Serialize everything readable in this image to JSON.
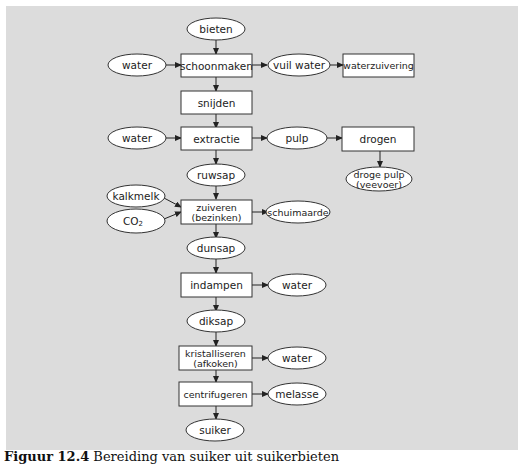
{
  "diagram": {
    "title": "Bereiding van suiker uit suikerbieten",
    "nodes": {
      "bieten": "bieten",
      "water1": "water",
      "schoonmaken": "schoonmaken",
      "vuil_water": "vuil water",
      "waterzuivering": "waterzuivering",
      "snijden": "snijden",
      "water2": "water",
      "extractie": "extractie",
      "pulp": "pulp",
      "drogen": "drogen",
      "droge_pulp_l1": "droge pulp",
      "droge_pulp_l2": "(veevoer)",
      "ruwsap": "ruwsap",
      "kalkmelk": "kalkmelk",
      "co2": "CO",
      "co2_sub": "2",
      "zuiveren_l1": "zuiveren",
      "zuiveren_l2": "(bezinken)",
      "schuimaarde": "schuimaarde",
      "dunsap": "dunsap",
      "indampen": "indampen",
      "water3": "water",
      "diksap": "diksap",
      "kristalliseren_l1": "kristalliseren",
      "kristalliseren_l2": "(afkoken)",
      "water4": "water",
      "centrifugeren": "centrifugeren",
      "melasse": "melasse",
      "suiker": "suiker"
    },
    "edges": [
      [
        "bieten",
        "schoonmaken"
      ],
      [
        "water1",
        "schoonmaken"
      ],
      [
        "schoonmaken",
        "vuil_water"
      ],
      [
        "vuil_water",
        "waterzuivering"
      ],
      [
        "schoonmaken",
        "snijden"
      ],
      [
        "snijden",
        "extractie"
      ],
      [
        "water2",
        "extractie"
      ],
      [
        "extractie",
        "pulp"
      ],
      [
        "pulp",
        "drogen"
      ],
      [
        "drogen",
        "droge_pulp"
      ],
      [
        "extractie",
        "ruwsap"
      ],
      [
        "ruwsap",
        "zuiveren"
      ],
      [
        "kalkmelk",
        "zuiveren"
      ],
      [
        "co2",
        "zuiveren"
      ],
      [
        "zuiveren",
        "schuimaarde"
      ],
      [
        "zuiveren",
        "dunsap"
      ],
      [
        "dunsap",
        "indampen"
      ],
      [
        "indampen",
        "water3"
      ],
      [
        "indampen",
        "diksap"
      ],
      [
        "diksap",
        "kristalliseren"
      ],
      [
        "kristalliseren",
        "water4"
      ],
      [
        "kristalliseren",
        "centrifugeren"
      ],
      [
        "centrifugeren",
        "melasse"
      ],
      [
        "centrifugeren",
        "suiker"
      ]
    ]
  },
  "caption": {
    "label": "Figuur 12.4",
    "text": "Bereiding van suiker uit suikerbieten"
  }
}
